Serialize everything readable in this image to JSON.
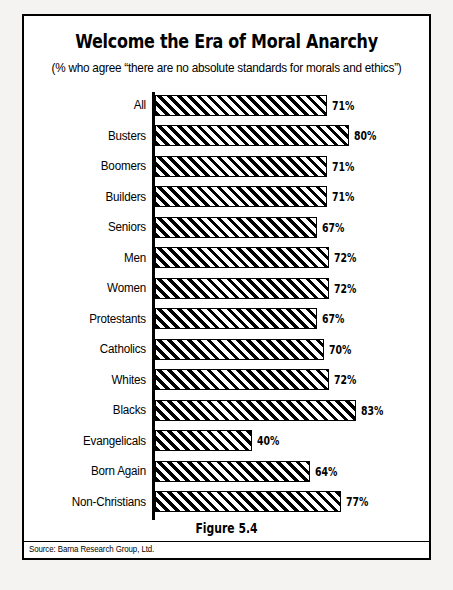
{
  "figure": {
    "title": "Welcome the Era of Moral Anarchy",
    "subtitle": "(% who agree “there are no absolute standards for morals and ethics”)",
    "caption": "Figure 5.4",
    "source": "Source: Barna Research Group, Ltd."
  },
  "chart_data": {
    "type": "bar",
    "orientation": "horizontal",
    "title": "Welcome the Era of Moral Anarchy",
    "subtitle": "(% who agree “there are no absolute standards for morals and ethics”)",
    "xlabel": "",
    "ylabel": "",
    "xlim": [
      0,
      100
    ],
    "grid": false,
    "legend": false,
    "value_suffix": "%",
    "categories": [
      "All",
      "Busters",
      "Boomers",
      "Builders",
      "Seniors",
      "Men",
      "Women",
      "Protestants",
      "Catholics",
      "Whites",
      "Blacks",
      "Evangelicals",
      "Born Again",
      "Non-Christians"
    ],
    "values": [
      71,
      80,
      71,
      71,
      67,
      72,
      72,
      67,
      70,
      72,
      83,
      40,
      64,
      77
    ],
    "labels": [
      "71%",
      "80%",
      "71%",
      "71%",
      "67%",
      "72%",
      "72%",
      "67%",
      "70%",
      "72%",
      "83%",
      "40%",
      "64%",
      "77%"
    ],
    "bars": [
      {
        "category": "All",
        "value": 71,
        "label": "71%"
      },
      {
        "category": "Busters",
        "value": 80,
        "label": "80%"
      },
      {
        "category": "Boomers",
        "value": 71,
        "label": "71%"
      },
      {
        "category": "Builders",
        "value": 71,
        "label": "71%"
      },
      {
        "category": "Seniors",
        "value": 67,
        "label": "67%"
      },
      {
        "category": "Men",
        "value": 72,
        "label": "72%"
      },
      {
        "category": "Women",
        "value": 72,
        "label": "72%"
      },
      {
        "category": "Protestants",
        "value": 67,
        "label": "67%"
      },
      {
        "category": "Catholics",
        "value": 70,
        "label": "70%"
      },
      {
        "category": "Whites",
        "value": 72,
        "label": "72%"
      },
      {
        "category": "Blacks",
        "value": 83,
        "label": "83%"
      },
      {
        "category": "Evangelicals",
        "value": 40,
        "label": "40%"
      },
      {
        "category": "Born Again",
        "value": 64,
        "label": "64%"
      },
      {
        "category": "Non-Christians",
        "value": 77,
        "label": "77%"
      }
    ],
    "colors": {
      "bar_fill": "#000000",
      "bar_hatch": "#ffffff",
      "bar_edge": "#000000",
      "background": "#ffffff",
      "text": "#000000"
    },
    "px_per_unit": 2.42
  }
}
